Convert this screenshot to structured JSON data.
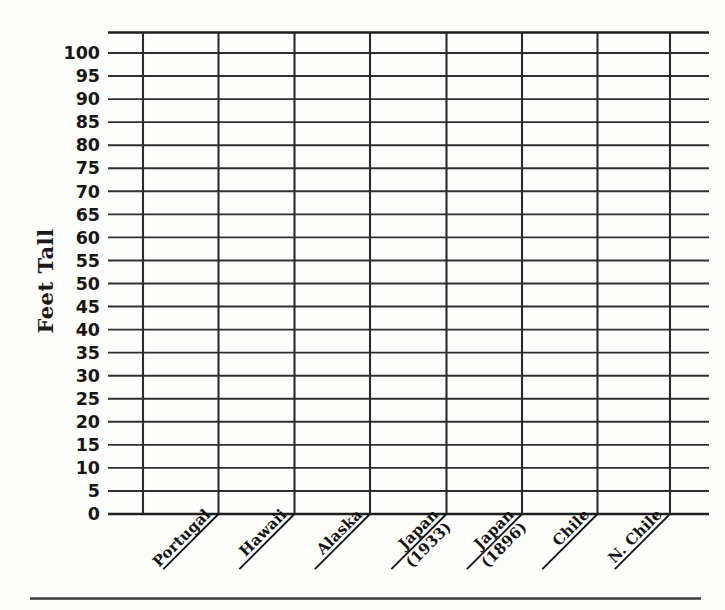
{
  "chart_data": {
    "type": "bar",
    "title": "",
    "subtitle": "",
    "xlabel": "",
    "ylabel": "Feet Tall",
    "ylim": [
      0,
      100
    ],
    "ytick_step": 5,
    "grid": true,
    "legend": "none",
    "note": "Blank worksheet grid — no bars plotted; all category values are empty/unfilled.",
    "categories": [
      "Portugal",
      "Hawaii",
      "Alaska",
      "Japan (1933)",
      "Japan (1896)",
      "Chile",
      "N. Chile"
    ],
    "values": [
      null,
      null,
      null,
      null,
      null,
      null,
      null
    ],
    "ytick_labels": [
      "100",
      "95",
      "90",
      "85",
      "80",
      "75",
      "70",
      "65",
      "60",
      "55",
      "50",
      "45",
      "40",
      "35",
      "30",
      "25",
      "20",
      "15",
      "10",
      "5",
      "0"
    ],
    "ytick_values": [
      100,
      95,
      90,
      85,
      80,
      75,
      70,
      65,
      60,
      55,
      50,
      45,
      40,
      35,
      30,
      25,
      20,
      15,
      10,
      5,
      0
    ]
  },
  "axes": {
    "y_axis_title": "Feet Tall"
  },
  "category_labels": [
    {
      "line1": "Portugal",
      "line2": ""
    },
    {
      "line1": "Hawaii",
      "line2": ""
    },
    {
      "line1": "Alaska",
      "line2": ""
    },
    {
      "line1": "Japan",
      "line2": "(1933)"
    },
    {
      "line1": "Japan",
      "line2": "(1896)"
    },
    {
      "line1": "Chile",
      "line2": ""
    },
    {
      "line1": "N. Chile",
      "line2": ""
    }
  ],
  "colors": {
    "background": "#fdfdfc",
    "grid": "#2f2f2f",
    "text": "#161616",
    "rule": "#3c3c3c"
  }
}
